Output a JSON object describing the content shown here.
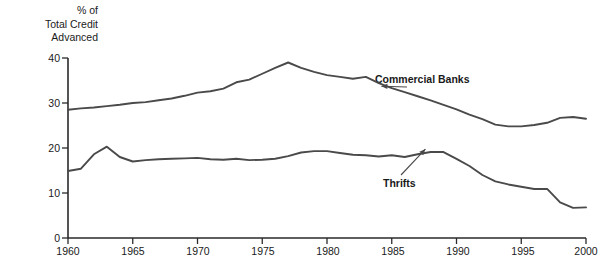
{
  "chart_data": {
    "type": "line",
    "title": "",
    "ylabel": "% of\nTotal Credit\nAdvanced",
    "xlabel": "",
    "xlim": [
      1960,
      2000
    ],
    "ylim": [
      0,
      40
    ],
    "grid": false,
    "legend_position": "inline-annotations",
    "y_ticks": [
      0,
      10,
      20,
      30,
      40
    ],
    "y_tick_labels": [
      "0",
      "10",
      "20",
      "30",
      "40"
    ],
    "x_ticks": [
      1960,
      1965,
      1970,
      1975,
      1980,
      1985,
      1990,
      1995,
      2000
    ],
    "x_tick_labels": [
      "1960",
      "1965",
      "1970",
      "1975",
      "1980",
      "1985",
      "1990",
      "1995",
      "2000"
    ],
    "x": [
      1960,
      1961,
      1962,
      1963,
      1964,
      1965,
      1966,
      1967,
      1968,
      1969,
      1970,
      1971,
      1972,
      1973,
      1974,
      1975,
      1976,
      1977,
      1978,
      1979,
      1980,
      1981,
      1982,
      1983,
      1984,
      1985,
      1986,
      1987,
      1988,
      1989,
      1990,
      1991,
      1992,
      1993,
      1994,
      1995,
      1996,
      1997,
      1998,
      1999,
      2000
    ],
    "series": [
      {
        "name": "Commercial Banks",
        "color": "#4a4a4a",
        "values": [
          28.5,
          28.8,
          29.0,
          29.3,
          29.6,
          30.0,
          30.2,
          30.6,
          31.0,
          31.6,
          32.3,
          32.6,
          33.2,
          34.6,
          35.2,
          36.5,
          37.8,
          39.0,
          37.8,
          36.9,
          36.2,
          35.8,
          35.4,
          35.8,
          34.4,
          33.3,
          32.4,
          31.5,
          30.6,
          29.6,
          28.6,
          27.4,
          26.4,
          25.2,
          24.8,
          24.8,
          25.1,
          25.6,
          26.7,
          26.9,
          26.5
        ]
      },
      {
        "name": "Thrifts",
        "color": "#4a4a4a",
        "values": [
          14.9,
          15.4,
          18.6,
          20.3,
          18.0,
          17.0,
          17.3,
          17.5,
          17.6,
          17.7,
          17.8,
          17.5,
          17.4,
          17.6,
          17.3,
          17.4,
          17.6,
          18.2,
          19.0,
          19.3,
          19.3,
          18.9,
          18.5,
          18.4,
          18.1,
          18.4,
          18.0,
          18.6,
          19.1,
          19.1,
          17.6,
          16.0,
          14.0,
          12.6,
          11.9,
          11.4,
          10.9,
          10.9,
          7.9,
          6.7,
          6.8
        ]
      }
    ],
    "annotations": [
      {
        "text": "Commercial Banks",
        "series": "Commercial Banks",
        "label_x": 375,
        "label_y": 73
      },
      {
        "text": "Thrifts",
        "series": "Thrifts",
        "label_x": 383,
        "label_y": 177
      }
    ]
  }
}
